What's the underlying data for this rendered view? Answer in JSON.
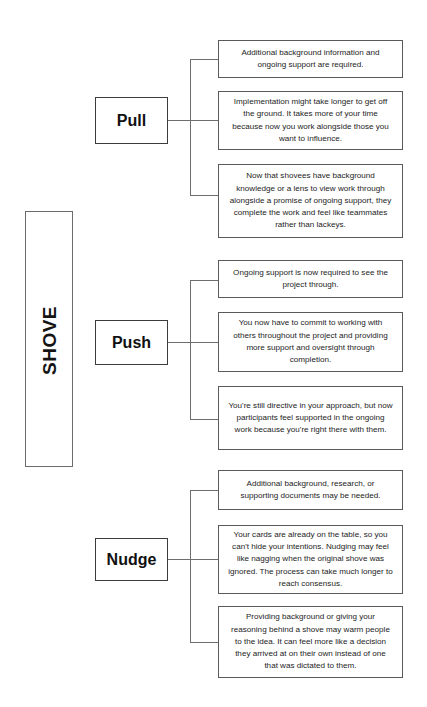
{
  "diagram": {
    "title": "SHOVE",
    "root_label": "SHOVE",
    "accent_color": "#1a1a1a",
    "border_color": "#5a5a5a",
    "background_color": "#ffffff",
    "branches": [
      {
        "label": "Pull",
        "details": [
          "Additional background information and ongoing support are required.",
          "Implementation might take longer to get off the ground. It takes more of your time because now you work alongside those you want to influence.",
          "Now that shovees have background knowledge or a lens to view work through alongside a promise of ongoing support, they complete the work and feel like teammates rather than lackeys."
        ]
      },
      {
        "label": "Push",
        "details": [
          "Ongoing support is now required to see the project through.",
          "You now have to commit to working with others throughout the project and providing more support and oversight through completion.",
          "You're still directive in your approach, but now participants feel supported in the ongoing work because you're right there with them."
        ]
      },
      {
        "label": "Nudge",
        "details": [
          "Additional background, research, or supporting documents may be needed.",
          "Your cards are already on the table, so you can't hide your intentions. Nudging may feel like nagging when the original shove was ignored. The process can take much longer to reach consensus.",
          "Providing background or giving your reasoning behind a shove may warm people to the idea. It can feel more like a decision they arrived at on their own instead of one that was dictated to them."
        ]
      }
    ]
  }
}
